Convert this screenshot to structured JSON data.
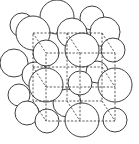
{
  "diagram": {
    "type": "crystal-lattice",
    "colors": {
      "stroke": "#2a2a2a",
      "fill": "#ffffff",
      "edge": "#333333"
    },
    "atoms": [
      {
        "cx": 57,
        "cy": 17,
        "r": 17
      },
      {
        "cx": 22,
        "cy": 25,
        "r": 12
      },
      {
        "cx": 92,
        "cy": 18,
        "r": 12
      },
      {
        "cx": 14,
        "cy": 63,
        "r": 14
      },
      {
        "cx": 19,
        "cy": 95,
        "r": 11
      },
      {
        "cx": 27,
        "cy": 113,
        "r": 12
      },
      {
        "cx": 33,
        "cy": 33,
        "r": 17
      },
      {
        "cx": 72,
        "cy": 33,
        "r": 15
      },
      {
        "cx": 105,
        "cy": 32,
        "r": 15
      },
      {
        "cx": 35,
        "cy": 75,
        "r": 13
      },
      {
        "cx": 97,
        "cy": 72,
        "r": 11
      },
      {
        "cx": 67,
        "cy": 103,
        "r": 14
      },
      {
        "cx": 46,
        "cy": 53,
        "r": 13
      },
      {
        "cx": 82,
        "cy": 50,
        "r": 17
      },
      {
        "cx": 113,
        "cy": 50,
        "r": 12
      },
      {
        "cx": 46,
        "cy": 85,
        "r": 17
      },
      {
        "cx": 80,
        "cy": 83,
        "r": 12
      },
      {
        "cx": 115,
        "cy": 85,
        "r": 17
      },
      {
        "cx": 47,
        "cy": 121,
        "r": 12
      },
      {
        "cx": 82,
        "cy": 120,
        "r": 17
      },
      {
        "cx": 115,
        "cy": 120,
        "r": 12
      }
    ],
    "edges": [
      [
        46,
        53,
        115,
        53
      ],
      [
        115,
        53,
        115,
        121
      ],
      [
        115,
        121,
        46,
        121
      ],
      [
        46,
        121,
        46,
        53
      ],
      [
        33,
        33,
        102,
        33
      ],
      [
        102,
        33,
        102,
        101
      ],
      [
        102,
        101,
        33,
        101
      ],
      [
        33,
        101,
        33,
        33
      ],
      [
        33,
        33,
        46,
        53
      ],
      [
        102,
        33,
        115,
        53
      ],
      [
        102,
        101,
        115,
        121
      ],
      [
        33,
        101,
        46,
        121
      ],
      [
        46,
        87,
        115,
        87
      ],
      [
        80,
        53,
        80,
        121
      ],
      [
        33,
        67,
        46,
        87
      ],
      [
        67,
        33,
        80,
        53
      ],
      [
        67,
        33,
        67,
        101
      ],
      [
        33,
        67,
        102,
        67
      ],
      [
        102,
        67,
        115,
        87
      ],
      [
        67,
        101,
        80,
        121
      ]
    ]
  }
}
